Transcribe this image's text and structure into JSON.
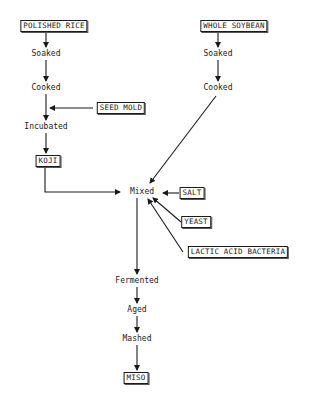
{
  "diagram": {
    "type": "flowchart",
    "title": "",
    "nodes": {
      "polished_rice": "POLISHED RICE",
      "rice_soaked": "Soaked",
      "rice_cooked": "Cooked",
      "seed_mold": "SEED MOLD",
      "incubated": "Incubated",
      "koji": "KOJI",
      "whole_soybean": "WHOLE SOYBEAN",
      "soy_soaked": "Soaked",
      "soy_cooked": "Cooked",
      "mixed": "Mixed",
      "salt": "SALT",
      "yeast": "YEAST",
      "lactic_acid_bacteria": "LACTIC ACID BACTERIA",
      "fermented": "Fermented",
      "aged": "Aged",
      "mashed": "Mashed",
      "miso": "MISO"
    },
    "edges": [
      [
        "POLISHED RICE",
        "Soaked"
      ],
      [
        "Soaked",
        "Cooked"
      ],
      [
        "Cooked",
        "Incubated"
      ],
      [
        "SEED MOLD",
        "Cooked→Incubated"
      ],
      [
        "Incubated",
        "KOJI"
      ],
      [
        "KOJI",
        "Mixed"
      ],
      [
        "WHOLE SOYBEAN",
        "Soaked"
      ],
      [
        "Soaked",
        "Cooked"
      ],
      [
        "Cooked",
        "Mixed"
      ],
      [
        "SALT",
        "Mixed"
      ],
      [
        "YEAST",
        "Mixed"
      ],
      [
        "LACTIC ACID BACTERIA",
        "Mixed"
      ],
      [
        "Mixed",
        "Fermented"
      ],
      [
        "Fermented",
        "Aged"
      ],
      [
        "Aged",
        "Mashed"
      ],
      [
        "Mashed",
        "MISO"
      ]
    ]
  }
}
